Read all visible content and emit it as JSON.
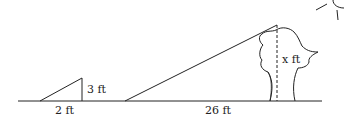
{
  "diagram": {
    "type": "similar-triangles-shadow-problem",
    "small_triangle": {
      "height_label": "3 ft",
      "base_label": "2 ft"
    },
    "tree": {
      "height_label": "x ft",
      "shadow_label": "26 ft"
    },
    "elements": [
      "ground-line",
      "small-triangle",
      "sun-ray",
      "tree",
      "sun"
    ],
    "line_color": "#222222"
  }
}
